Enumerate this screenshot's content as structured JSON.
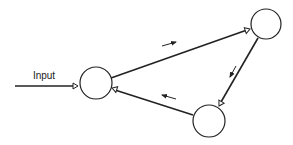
{
  "diagram": {
    "type": "network",
    "colors": {
      "stroke": "#222222",
      "background": "#ffffff"
    },
    "input": {
      "label": "Input",
      "label_x": 44,
      "label_y": 79,
      "line": {
        "x1": 15,
        "y1": 86,
        "x2": 73,
        "y2": 86
      },
      "terminal": {
        "x": 78,
        "y": 86,
        "angle": 0
      }
    },
    "nodes": [
      {
        "id": "node-left",
        "cx": 96,
        "cy": 83,
        "r": 16
      },
      {
        "id": "node-top-right",
        "cx": 266,
        "cy": 24,
        "r": 15
      },
      {
        "id": "node-bottom",
        "cx": 209,
        "cy": 121,
        "r": 16
      }
    ],
    "edges": [
      {
        "id": "edge-left-to-topright",
        "from": "node-left",
        "to": "node-top-right",
        "line": {
          "x1": 111,
          "y1": 78,
          "x2": 247,
          "y2": 30
        },
        "terminal": {
          "x": 250,
          "y": 29,
          "angle": -19
        },
        "direction_arrow": {
          "x1": 162,
          "y1": 46,
          "x2": 176,
          "y2": 42
        }
      },
      {
        "id": "edge-topright-to-bottom",
        "from": "node-top-right",
        "to": "node-bottom",
        "line": {
          "x1": 258,
          "y1": 38,
          "x2": 221,
          "y2": 102
        },
        "terminal": {
          "x": 219,
          "y": 106,
          "angle": 120
        },
        "direction_arrow": {
          "x1": 236,
          "y1": 66,
          "x2": 230,
          "y2": 77
        }
      },
      {
        "id": "edge-bottom-to-left",
        "from": "node-bottom",
        "to": "node-left",
        "line": {
          "x1": 193,
          "y1": 115,
          "x2": 115,
          "y2": 90
        },
        "terminal": {
          "x": 112,
          "y": 88,
          "angle": 198
        },
        "direction_arrow": {
          "x1": 176,
          "y1": 99,
          "x2": 162,
          "y2": 95
        }
      }
    ]
  }
}
